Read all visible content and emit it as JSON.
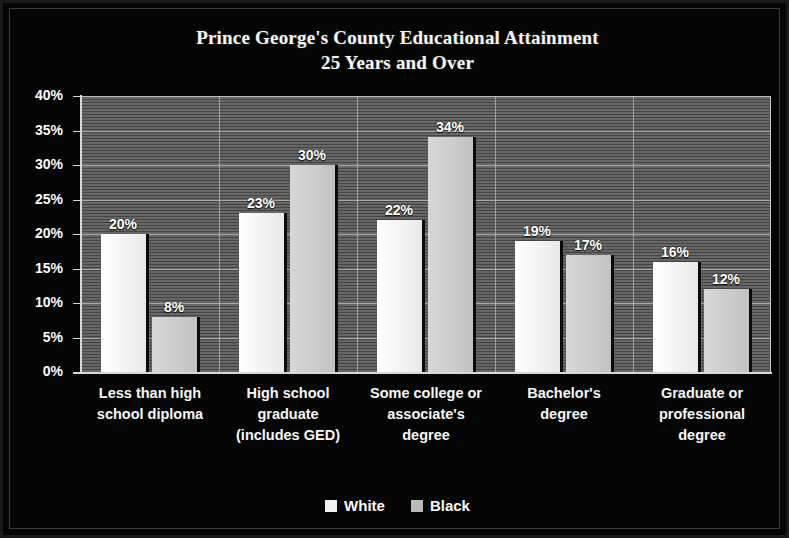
{
  "chart_data": {
    "type": "bar",
    "title": "Prince George's County Educational Attainment",
    "subtitle": "25 Years and Over",
    "xlabel": "",
    "ylabel": "",
    "ylim": [
      0,
      40
    ],
    "ytick_labels": [
      "40%",
      "35%",
      "30%",
      "25%",
      "20%",
      "15%",
      "10%",
      "5%",
      "0%"
    ],
    "ytick_values": [
      40,
      35,
      30,
      25,
      20,
      15,
      10,
      5,
      0
    ],
    "grid": true,
    "legend_position": "bottom",
    "categories": [
      "Less than high school diploma",
      "High school graduate (includes GED)",
      "Some college or associate's degree",
      "Bachelor's degree",
      "Graduate or professional degree"
    ],
    "category_label_lines": [
      [
        "Less than high",
        "school diploma"
      ],
      [
        "High school",
        "graduate",
        "(includes GED)"
      ],
      [
        "Some college or",
        "associate's",
        "degree"
      ],
      [
        "Bachelor's",
        "degree"
      ],
      [
        "Graduate or",
        "professional",
        "degree"
      ]
    ],
    "series": [
      {
        "name": "White",
        "color": "#f2f2f2",
        "values": [
          20,
          23,
          22,
          19,
          16
        ],
        "value_labels": [
          "20%",
          "23%",
          "22%",
          "19%",
          "16%"
        ]
      },
      {
        "name": "Black",
        "color": "#cccccc",
        "values": [
          8,
          30,
          34,
          17,
          12
        ],
        "value_labels": [
          "8%",
          "30%",
          "34%",
          "17%",
          "12%"
        ]
      }
    ]
  },
  "legend": {
    "items": [
      {
        "label": "White",
        "swatch": "white"
      },
      {
        "label": "Black",
        "swatch": "black"
      }
    ]
  },
  "colors": {
    "background": "#050505",
    "plot_background": "#5e5e5e",
    "gridline": "#b9b9b9",
    "axis": "#d8d8d8",
    "text": "#fafafa",
    "white_bar": "#f3f3f3",
    "black_bar": "#cccccc"
  }
}
